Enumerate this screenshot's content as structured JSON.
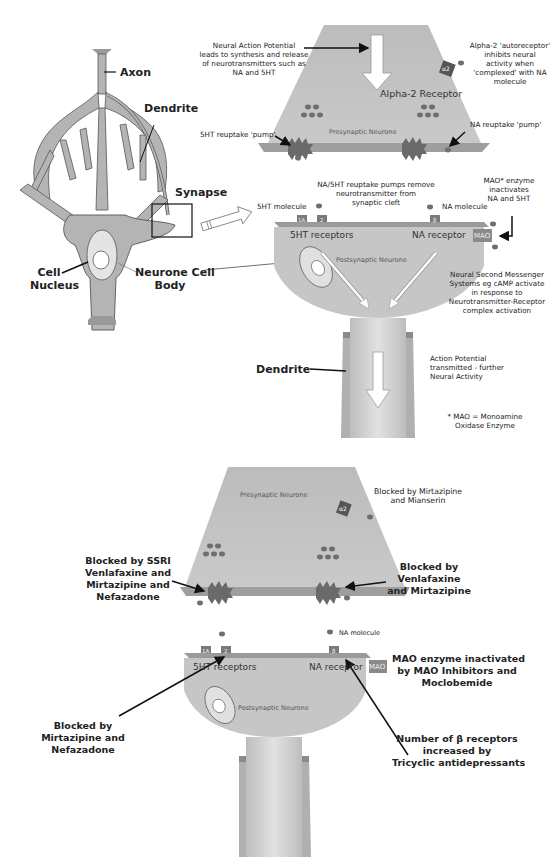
{
  "neuron": {
    "axon": "Axon",
    "dendrite": "Dendrite",
    "synapse": "Synapse",
    "cell_nucleus_1": "Cell",
    "cell_nucleus_2": "Nucleus",
    "cell_body_1": "Neurone Cell",
    "cell_body_2": "Body"
  },
  "top_panel": {
    "action_potential": [
      "Neural Action Potential",
      "leads to synthesis and release",
      "of neurotransmitters such as",
      "NA and 5HT"
    ],
    "alpha2_note": [
      "Alpha-2 'autoreceptor'",
      "inhibits neural",
      "activity when",
      "'complexed' with NA",
      "molecule"
    ],
    "alpha2_receptor": "Alpha-2 Receptor",
    "alpha2_glyph": "α2",
    "ht_pump": "5HT reuptake 'pump'",
    "na_pump": "NA reuptake 'pump'",
    "presynaptic": "Presynaptic Neurone",
    "reuptake_note": [
      "NA/5HT reuptake pumps remove",
      "neurotransmitter from",
      "synaptic cleft"
    ],
    "mao_note": [
      "MAO* enzyme",
      "inactivates",
      "NA and 5HT"
    ],
    "ht_molecule": "5HT molecule",
    "na_molecule": "NA molecule",
    "rec_1a": "1A",
    "rec_2": "2",
    "rec_beta": "β",
    "ht_receptors": "5HT receptors",
    "na_receptor": "NA receptor",
    "mao_box": "MAO",
    "postsynaptic": "Postsynaptic Neurone",
    "second_messenger": [
      "Neural Second Messenger",
      "Systems eg cAMP activate",
      "in response to",
      "Neurotransmitter-Receptor",
      "complex activation"
    ],
    "dendrite": "Dendrite",
    "ap_transmitted": [
      "Action Potential",
      "transmitted - further",
      "Neural Activity"
    ],
    "footnote": [
      "* MAO = Monoamine",
      "Oxidase Enzyme"
    ]
  },
  "bottom_panel": {
    "presynaptic": "Presynaptic Neurone",
    "alpha2_glyph": "α2",
    "mirtazipine_mianserin": [
      "Blocked by Mirtazipine",
      "and Mianserin"
    ],
    "ssri_block": [
      "Blocked by SSRI",
      "Venlafaxine and",
      "Mirtazipine and",
      "Nefazadone"
    ],
    "na_pump_block": [
      "Blocked by",
      "Venlafaxine",
      "and Mirtazipine"
    ],
    "na_molecule": "NA molecule",
    "rec_1a": "1A",
    "rec_2": "2",
    "rec_beta": "β",
    "ht_receptors": "5HT receptors",
    "na_receptor": "NA receptor",
    "mao_box": "MAO",
    "mao_inhibit": [
      "MAO enzyme inactivated",
      "by MAO Inhibitors and",
      "Moclobemide"
    ],
    "postsynaptic": "Postsynaptic Neurone",
    "ht2_block": [
      "Blocked by",
      "Mirtazipine and",
      "Nefazadone"
    ],
    "beta_increase": [
      "Number of β receptors",
      "increased by",
      "Tricyclic antidepressants"
    ]
  },
  "colors": {
    "neuron_fill": "#b4b4b4",
    "cell_fill": "#c8c8c8",
    "membrane": "#8a8a8a",
    "molecule": "#6e6e6e",
    "pump": "#6a6a6a"
  }
}
